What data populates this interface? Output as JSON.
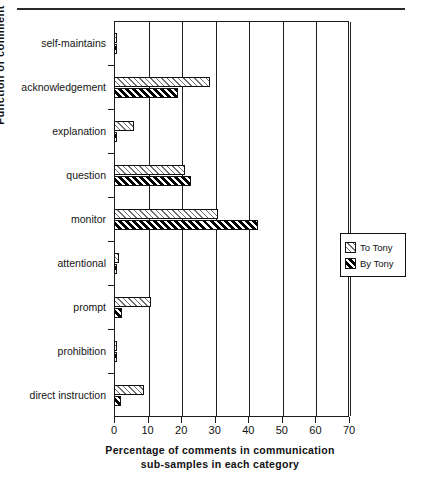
{
  "figure": {
    "top_rule": true
  },
  "legend": {
    "position": "right-middle",
    "entries": [
      {
        "label": "To  Tony",
        "pattern": "light-hatch"
      },
      {
        "label": "By  Tony",
        "pattern": "dark-hatch"
      }
    ]
  },
  "chart_data": {
    "type": "bar",
    "orientation": "horizontal",
    "title": "",
    "xlabel": "Percentage of comments in communication sub-samples in each category",
    "xlabel_line1": "Percentage of comments in communication",
    "xlabel_line2": "sub-samples in each category",
    "ylabel": "Function  of  comment",
    "xlim": [
      0,
      70
    ],
    "xticks": [
      0,
      10,
      20,
      30,
      40,
      50,
      60,
      70
    ],
    "xticklabels": [
      "0",
      "10",
      "20",
      "30",
      "40",
      "50",
      "60",
      "70"
    ],
    "grid": "vertical",
    "legend_position": "right",
    "categories": [
      "self-maintains",
      "acknowledgement",
      "explanation",
      "question",
      "monitor",
      "attentional",
      "prompt",
      "prohibition",
      "direct  instruction"
    ],
    "series": [
      {
        "name": "To  Tony",
        "values": [
          1.0,
          28.5,
          6.0,
          21.0,
          31.0,
          1.5,
          11.0,
          0.8,
          9.0
        ]
      },
      {
        "name": "By  Tony",
        "values": [
          1.0,
          19.0,
          0.6,
          23.0,
          43.0,
          1.0,
          2.5,
          0.8,
          2.0
        ]
      }
    ]
  }
}
